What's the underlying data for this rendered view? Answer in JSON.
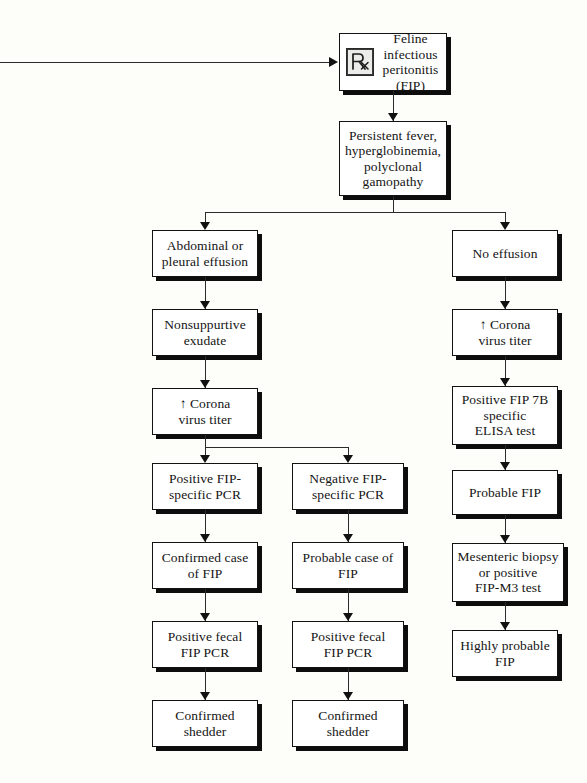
{
  "diagram": {
    "icons": {
      "rx": "rx-prescription-icon"
    },
    "nodes": {
      "root": {
        "label": "Feline\ninfectious\nperitonitis (FIP)"
      },
      "signs": {
        "label": "Persistent fever,\nhyperglobinemia,\npolyclonal\ngamopathy"
      },
      "effusion": {
        "label": "Abdominal or\npleural effusion"
      },
      "no_effusion": {
        "label": "No effusion"
      },
      "exudate": {
        "label": "Nonsuppurtive\nexudate"
      },
      "titer_left": {
        "label": "↑ Corona\nvirus titer"
      },
      "titer_right": {
        "label": "↑ Corona\nvirus titer"
      },
      "elisa": {
        "label": "Positive FIP 7B\nspecific\nELISA test"
      },
      "pcr_pos": {
        "label": "Positive FIP-\nspecific PCR"
      },
      "pcr_neg": {
        "label": "Negative FIP-\nspecific PCR"
      },
      "confirmed_case": {
        "label": "Confirmed case\nof FIP"
      },
      "probable_case": {
        "label": "Probable case of\nFIP"
      },
      "probable_fip": {
        "label": "Probable FIP"
      },
      "fecal_left": {
        "label": "Positive fecal\nFIP PCR"
      },
      "fecal_mid": {
        "label": "Positive fecal\nFIP PCR"
      },
      "biopsy": {
        "label": "Mesenteric biopsy\nor positive\nFIP-M3 test"
      },
      "shedder_left": {
        "label": "Confirmed\nshedder"
      },
      "shedder_mid": {
        "label": "Confirmed\nshedder"
      },
      "highly_probable": {
        "label": "Highly probable\nFIP"
      }
    },
    "colors": {
      "background": "#fdfdfa",
      "box_fill": "#ffffff",
      "box_border": "#121212",
      "shadow": "#0d0d0d",
      "connector": "#2b2b2b",
      "text": "#141414"
    }
  }
}
